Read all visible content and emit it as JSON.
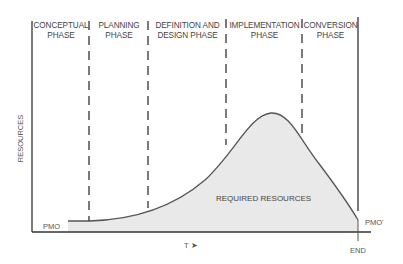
{
  "phases": [
    {
      "line1": "CONCEPTUAL",
      "line2": "PHASE"
    },
    {
      "line1": "PLANNING",
      "line2": "PHASE"
    },
    {
      "line1": "DEFINITION AND",
      "line2": "DESIGN PHASE"
    },
    {
      "line1": "IMPLEMENTATION",
      "line2": "PHASE"
    },
    {
      "line1": "CONVERSION",
      "line2": "PHASE"
    }
  ],
  "axes": {
    "y_label": "RESOURCES",
    "x_label": "T ➤",
    "start_label": "PMO",
    "end_level_label": "PMO'",
    "end_label": "END"
  },
  "area_label": "REQUIRED RESOURCES",
  "colors": {
    "line": "#333333",
    "fill": "#e9e9e9",
    "curve": "#555555"
  }
}
